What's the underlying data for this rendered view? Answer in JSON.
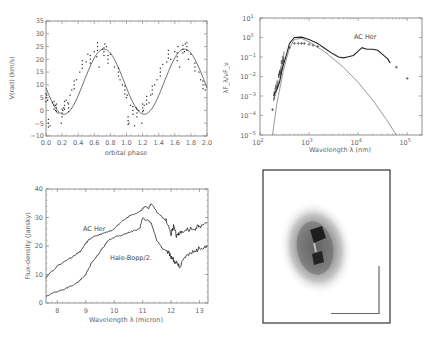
{
  "chart_data": [
    {
      "id": "radial-velocity",
      "type": "scatter",
      "title": "",
      "xlabel": "orbital phase",
      "ylabel": "V(rad) (km/s)",
      "xlim": [
        0.0,
        2.0
      ],
      "ylim": [
        -10,
        35
      ],
      "xticks": [
        "0.0",
        "0.2",
        "0.4",
        "0.6",
        "0.8",
        "1.0",
        "1.2",
        "1.4",
        "1.6",
        "1.8",
        "2.0"
      ],
      "yticks": [
        "-10",
        "-5",
        "0",
        "5",
        "10",
        "15",
        "20",
        "25",
        "30",
        "35"
      ],
      "grid": false,
      "series": [
        {
          "name": "fit (sinusoid)",
          "style": "line",
          "mean": 11.25,
          "amplitude": 12.75,
          "phase_of_max": 0.72,
          "period": 1.0
        },
        {
          "name": "observations",
          "style": "points",
          "x": [
            0.0,
            0.01,
            0.02,
            0.03,
            0.05,
            0.08,
            0.1,
            0.12,
            0.12,
            0.13,
            0.15,
            0.19,
            0.2,
            0.21,
            0.22,
            0.23,
            0.25,
            0.27,
            0.28,
            0.3,
            0.32,
            0.35,
            0.38,
            0.42,
            0.45,
            0.5,
            0.52,
            0.55,
            0.6,
            0.63,
            0.64,
            0.66,
            0.7,
            0.72,
            0.73,
            0.75,
            0.77,
            0.8,
            0.85,
            0.9,
            0.92,
            0.95,
            0.98,
            1.0,
            1.01,
            1.02,
            1.03,
            1.05,
            1.08,
            1.1,
            1.12,
            1.13,
            1.15,
            1.19,
            1.2,
            1.21,
            1.22,
            1.25,
            1.28,
            1.3,
            1.32,
            1.35,
            1.38,
            1.42,
            1.45,
            1.5,
            1.52,
            1.55,
            1.6,
            1.63,
            1.64,
            1.66,
            1.7,
            1.72,
            1.73,
            1.75,
            1.77,
            1.8,
            1.85,
            1.9,
            1.92,
            1.95,
            1.98
          ],
          "y": [
            5,
            6,
            4,
            -5,
            -6,
            3,
            2,
            0,
            2,
            1,
            -1,
            -5,
            -1,
            0,
            1,
            2,
            4,
            3,
            1,
            6,
            8,
            10,
            12,
            15,
            18,
            19,
            22,
            20,
            23,
            21,
            25,
            17,
            24,
            23,
            26,
            25,
            20,
            22,
            17,
            15,
            12,
            10,
            8,
            5,
            6,
            -4,
            -5,
            2,
            0,
            -6,
            1,
            -1,
            0,
            -5,
            1,
            0,
            2,
            4,
            3,
            6,
            8,
            10,
            12,
            15,
            18,
            19,
            22,
            20,
            23,
            21,
            25,
            17,
            24,
            23,
            26,
            25,
            20,
            22,
            17,
            15,
            12,
            10,
            8
          ]
        }
      ]
    },
    {
      "id": "sed",
      "type": "line",
      "title": "",
      "annotation": "AC Her",
      "xlabel": "Wavelength λ (nm)",
      "ylabel": "λF_λ / νF_ν",
      "xscale": "log",
      "yscale": "log",
      "xlim": [
        100,
        200000
      ],
      "ylim": [
        1e-05,
        10
      ],
      "xticks": [
        "10^2",
        "10^3",
        "10^4",
        "10^5"
      ],
      "yticks": [
        "10^-5",
        "10^-4",
        "10^-3",
        "10^-2",
        "10^-1",
        "10^0",
        "10^1"
      ],
      "grid": false,
      "series": [
        {
          "name": "stellar model",
          "style": "thin-line",
          "x": [
            180,
            220,
            300,
            400,
            500,
            700,
            1000,
            2000,
            5000,
            10000,
            20000,
            40000,
            60000
          ],
          "y": [
            1e-05,
            0.0004,
            0.02,
            0.3,
            0.8,
            0.9,
            0.6,
            0.2,
            0.03,
            0.005,
            0.0006,
            5e-05,
            1e-05
          ]
        },
        {
          "name": "observed SED",
          "style": "line",
          "x": [
            190,
            200,
            220,
            250,
            280,
            300,
            350,
            400,
            500,
            700,
            1000,
            1500,
            2000,
            3000,
            4000,
            5000,
            6000,
            8000,
            10000,
            12000,
            15000,
            20000,
            25000,
            30000,
            40000,
            45000
          ],
          "y": [
            0.001,
            0.0015,
            0.002,
            0.005,
            0.02,
            0.04,
            0.15,
            0.5,
            1.0,
            1.05,
            0.8,
            0.5,
            0.3,
            0.15,
            0.1,
            0.09,
            0.1,
            0.12,
            0.2,
            0.3,
            0.25,
            0.25,
            0.22,
            0.15,
            0.08,
            0.05
          ]
        },
        {
          "name": "photometry",
          "style": "plus-markers",
          "x": [
            180,
            400,
            500,
            600,
            700,
            800,
            1000,
            1200,
            1500,
            60000,
            100000
          ],
          "y": [
            0.0002,
            0.3,
            0.5,
            0.5,
            0.5,
            0.5,
            0.45,
            0.4,
            0.35,
            0.03,
            0.008
          ]
        }
      ]
    },
    {
      "id": "mid-ir-spectrum",
      "type": "line",
      "title": "",
      "xlabel": "Wavelength λ (micron)",
      "ylabel": "Flux-density (Jansky)",
      "xlim": [
        7.6,
        13.3
      ],
      "ylim": [
        0,
        40
      ],
      "xticks": [
        "8",
        "9",
        "10",
        "11",
        "12",
        "13"
      ],
      "yticks": [
        "0",
        "10",
        "20",
        "30",
        "40"
      ],
      "grid": false,
      "series": [
        {
          "name": "AC Her",
          "x": [
            7.6,
            8.0,
            8.5,
            8.8,
            9.0,
            9.2,
            9.5,
            9.8,
            10.0,
            10.3,
            10.6,
            10.9,
            11.0,
            11.1,
            11.2,
            11.3,
            11.5,
            11.7,
            11.9,
            12.0,
            12.1,
            12.2,
            12.3,
            12.5,
            12.8,
            13.0,
            13.3
          ],
          "y": [
            9,
            13,
            16,
            18,
            21,
            23,
            24,
            25,
            26,
            29,
            31,
            32,
            33,
            34,
            33,
            35,
            32,
            30,
            28,
            24,
            27,
            23,
            25,
            26,
            26,
            27,
            28
          ]
        },
        {
          "name": "Hale-Bopp/2.",
          "x": [
            7.6,
            8.0,
            8.5,
            8.8,
            9.0,
            9.2,
            9.5,
            9.8,
            10.0,
            10.3,
            10.6,
            10.9,
            11.0,
            11.1,
            11.2,
            11.3,
            11.5,
            11.7,
            11.9,
            12.0,
            12.1,
            12.2,
            12.3,
            12.5,
            12.8,
            13.0,
            13.3
          ],
          "y": [
            2.5,
            4,
            6,
            8,
            10,
            14,
            18,
            22,
            23,
            24,
            25,
            26,
            30,
            29,
            29,
            28,
            22,
            19,
            18,
            16,
            15,
            14,
            13,
            16,
            18,
            19,
            20
          ]
        }
      ]
    }
  ],
  "labels": {
    "a_xlabel": "orbital phase",
    "a_ylabel": "V(rad) (km/s)",
    "b_xlabel": "Wavelength  λ  (nm)",
    "b_ylabel": "λF_λ/νF_ν",
    "b_annotation": "AC Her",
    "c_xlabel": "Wavelength  λ  (micron)",
    "c_ylabel": "Flux-density (Jansky)",
    "c_ann_achr": "AC Her",
    "c_ann_hb": "Hale-Bopp/2."
  },
  "image_panel": {
    "description": "greyscale image of a double-lobed nebula with scale bar",
    "frame_color": "#333333",
    "scalebar_color": "#666666"
  }
}
